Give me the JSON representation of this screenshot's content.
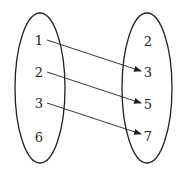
{
  "diagram": {
    "type": "mapping",
    "left_set": {
      "elements": [
        "1",
        "2",
        "3",
        "6"
      ]
    },
    "right_set": {
      "elements": [
        "2",
        "3",
        "5",
        "7"
      ]
    },
    "arrows": [
      {
        "from": "1",
        "to": "3"
      },
      {
        "from": "2",
        "to": "5"
      },
      {
        "from": "3",
        "to": "7"
      }
    ],
    "colors": {
      "stroke": "#222222",
      "background": "#ffffff"
    }
  }
}
